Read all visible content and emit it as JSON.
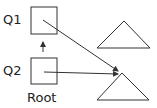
{
  "diagram": {
    "nodes": [
      {
        "id": "q1",
        "label": "Q1"
      },
      {
        "id": "q2",
        "label": "Q2"
      }
    ],
    "root_label": "Root",
    "colors": {
      "stroke": "#333333",
      "background": "#ffffff"
    }
  }
}
